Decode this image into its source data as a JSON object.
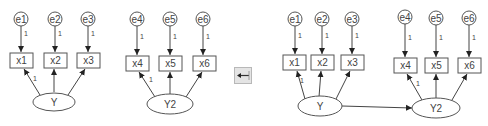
{
  "left_model": {
    "errors": [
      "e1",
      "e2",
      "e3"
    ],
    "indicators": [
      "x1",
      "x2",
      "x3"
    ],
    "latent": "Y",
    "error_loading": "1",
    "fixed_loading": "1"
  },
  "middle_model": {
    "errors": [
      "e4",
      "e5",
      "e6"
    ],
    "indicators": [
      "x4",
      "x5",
      "x6"
    ],
    "latent": "Y2",
    "error_loading": "1",
    "fixed_loading": "1"
  },
  "combined_model": {
    "errors": [
      "e1",
      "e2",
      "e3",
      "e4",
      "e5",
      "e6"
    ],
    "indicators": [
      "x1",
      "x2",
      "x3",
      "x4",
      "x5",
      "x6"
    ],
    "latents": [
      "Y",
      "Y2"
    ],
    "error_loading": "1",
    "fixed_loading": "1"
  },
  "button": {
    "icon": "arrow-left-icon"
  },
  "colors": {
    "stroke": "#555555",
    "button_bg": "#e4e4e4"
  }
}
